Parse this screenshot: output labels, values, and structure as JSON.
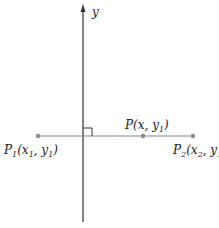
{
  "diagram": {
    "axis_label": "y",
    "points": [
      {
        "id": "P1",
        "name": "P",
        "sub": "1",
        "coords": "(x",
        "coords_sub": "1",
        "sep": ", y",
        "y_sub": "1",
        "close": ")"
      },
      {
        "id": "P",
        "name": "P",
        "sub": "",
        "coords": "(x",
        "coords_sub": "",
        "sep": ", y",
        "y_sub": "1",
        "close": ")"
      },
      {
        "id": "P2",
        "name": "P",
        "sub": "2",
        "coords": "(x",
        "coords_sub": "2",
        "sep": ", y",
        "y_sub": "1",
        "close": ")"
      }
    ],
    "colors": {
      "axis": "#333333",
      "segment": "#888888",
      "point": "#888888"
    }
  }
}
